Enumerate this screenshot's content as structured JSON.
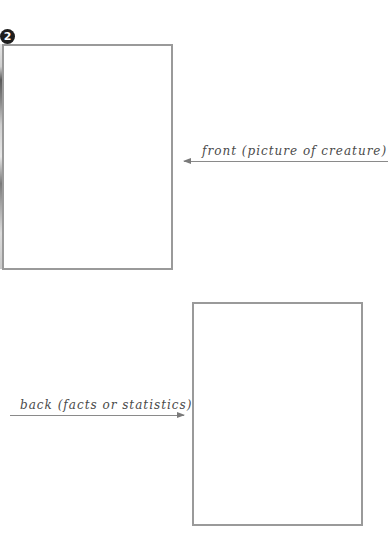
{
  "diagram": {
    "step_number": "2",
    "front_card": {
      "label": "front (picture of creature)",
      "arrow_direction": "left"
    },
    "back_card": {
      "label": "back (facts or statistics)",
      "arrow_direction": "right"
    },
    "colors": {
      "border": "#9a9a9a",
      "text": "#4a4a4a",
      "badge": "#1e1e1e"
    }
  }
}
